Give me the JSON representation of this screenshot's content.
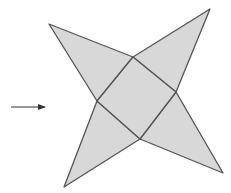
{
  "diagram": {
    "colors": {
      "fill": "#d8d8d8",
      "stroke": "#555555",
      "arrow": "#333333",
      "background": "#ffffff"
    },
    "square": [
      [
        133,
        57
      ],
      [
        176,
        92
      ],
      [
        140,
        139
      ],
      [
        97,
        101
      ]
    ],
    "triangles": [
      {
        "name": "top-left-face",
        "points": [
          [
            133,
            57
          ],
          [
            97,
            101
          ],
          [
            49,
            24
          ]
        ]
      },
      {
        "name": "top-right-face",
        "points": [
          [
            133,
            57
          ],
          [
            176,
            92
          ],
          [
            210,
            9
          ]
        ]
      },
      {
        "name": "bottom-right-face",
        "points": [
          [
            176,
            92
          ],
          [
            140,
            139
          ],
          [
            223,
            173
          ]
        ]
      },
      {
        "name": "bottom-left-face",
        "points": [
          [
            140,
            139
          ],
          [
            97,
            101
          ],
          [
            64,
            187
          ]
        ]
      }
    ],
    "arrow": {
      "from": [
        11,
        107
      ],
      "to": [
        45,
        107
      ]
    }
  }
}
